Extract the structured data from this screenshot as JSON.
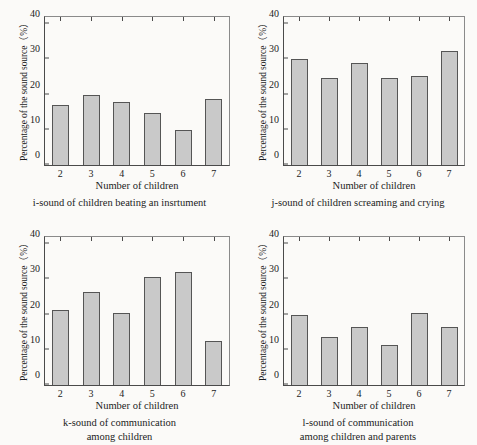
{
  "figure": {
    "background_color": "#fbfaf8",
    "bar_fill_color": "#c9c9c9",
    "bar_edge_color": "#555555",
    "axis_color": "#4a4a4a"
  },
  "chart_data": [
    {
      "type": "bar",
      "panel_letter": "i",
      "title": "i-sound of children beating an insrtument",
      "caption_lines": [
        "i-sound of children beating an insrtument"
      ],
      "xlabel": "Number of children",
      "ylabel": "Percentage of the sound source（%）",
      "categories": [
        "2",
        "3",
        "4",
        "5",
        "6",
        "7"
      ],
      "values": [
        17.0,
        20.0,
        17.8,
        14.8,
        9.8,
        18.7
      ],
      "ylim": [
        0,
        42
      ],
      "yticks": [
        0,
        10,
        20,
        30,
        40
      ],
      "grid": false,
      "legend": null
    },
    {
      "type": "bar",
      "panel_letter": "j",
      "title": "j-sound of children screaming and crying",
      "caption_lines": [
        "j-sound of children screaming and crying"
      ],
      "xlabel": "Number of children",
      "ylabel": "Percentage of the sound source（%）",
      "categories": [
        "2",
        "3",
        "4",
        "5",
        "6",
        "7"
      ],
      "values": [
        30.0,
        24.8,
        29.0,
        24.6,
        25.4,
        32.4
      ],
      "ylim": [
        0,
        42
      ],
      "yticks": [
        0,
        10,
        20,
        30,
        40
      ],
      "grid": false,
      "legend": null
    },
    {
      "type": "bar",
      "panel_letter": "k",
      "title": "k-sound of communication among children",
      "caption_lines": [
        "k-sound of communication",
        "among children"
      ],
      "xlabel": "Number of children",
      "ylabel": "Percentage of the sound source（%）",
      "categories": [
        "2",
        "3",
        "4",
        "5",
        "6",
        "7"
      ],
      "values": [
        21.4,
        26.3,
        20.3,
        30.7,
        32.2,
        12.5
      ],
      "ylim": [
        0,
        42
      ],
      "yticks": [
        0,
        10,
        20,
        30,
        40
      ],
      "grid": false,
      "legend": null
    },
    {
      "type": "bar",
      "panel_letter": "l",
      "title": "l-sound of communication among children and parents",
      "caption_lines": [
        "l-sound of communication",
        "among children and parents"
      ],
      "xlabel": "Number of children",
      "ylabel": "Percentage of the sound source（%）",
      "categories": [
        "2",
        "3",
        "4",
        "5",
        "6",
        "7"
      ],
      "values": [
        19.9,
        13.7,
        16.6,
        11.4,
        20.3,
        16.5
      ],
      "ylim": [
        0,
        42
      ],
      "yticks": [
        0,
        10,
        20,
        30,
        40
      ],
      "grid": false,
      "legend": null
    }
  ]
}
